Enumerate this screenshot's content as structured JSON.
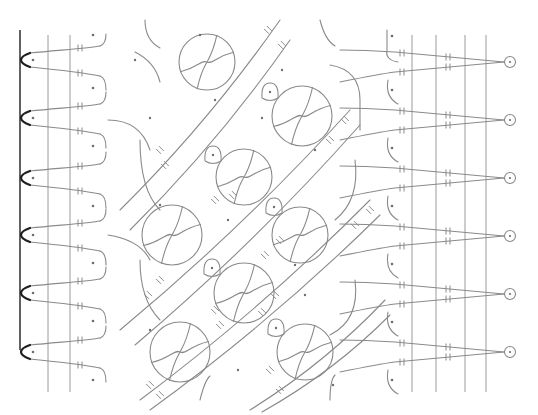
{
  "diagram": {
    "title": "",
    "type": "bobbin-lace-pricking",
    "width": 538,
    "height": 415,
    "colors": {
      "background": "#ffffff",
      "thread": "#8a8a8a",
      "border": "#3a3a3a",
      "picot": "#1e1e1e",
      "pin": "#6e6e6e"
    },
    "border_line": {
      "x": 20,
      "y1": 30,
      "y2": 350
    },
    "left_guides": [
      {
        "x": 48,
        "y1": 35,
        "y2": 392
      },
      {
        "x": 70,
        "y1": 35,
        "y2": 392
      }
    ],
    "right_guides": [
      {
        "x": 412,
        "y1": 35,
        "y2": 392
      },
      {
        "x": 436,
        "y1": 35,
        "y2": 392
      },
      {
        "x": 465,
        "y1": 35,
        "y2": 392
      },
      {
        "x": 486,
        "y1": 35,
        "y2": 392
      }
    ],
    "left_picots": [
      60,
      118,
      178,
      235,
      293,
      352
    ],
    "right_pinholes": [
      62,
      120,
      178,
      236,
      294,
      352
    ],
    "right_pinhole_x": 510,
    "large_rings": [
      {
        "cx": 207,
        "cy": 62,
        "r": 28
      },
      {
        "cx": 302,
        "cy": 116,
        "r": 30
      },
      {
        "cx": 244,
        "cy": 177,
        "r": 28
      },
      {
        "cx": 172,
        "cy": 235,
        "r": 30
      },
      {
        "cx": 300,
        "cy": 235,
        "r": 28
      },
      {
        "cx": 244,
        "cy": 293,
        "r": 30
      },
      {
        "cx": 180,
        "cy": 352,
        "r": 30
      },
      {
        "cx": 305,
        "cy": 352,
        "r": 28
      }
    ],
    "small_loops": [
      {
        "cx": 270,
        "cy": 92
      },
      {
        "cx": 213,
        "cy": 155
      },
      {
        "cx": 274,
        "cy": 207
      },
      {
        "cx": 212,
        "cy": 268
      },
      {
        "cx": 276,
        "cy": 328
      }
    ],
    "labels": []
  }
}
